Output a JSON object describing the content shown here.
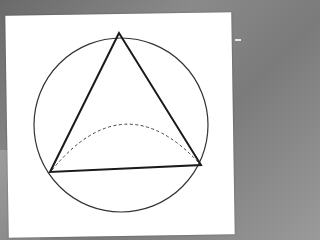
{
  "figure": {
    "type": "geometry-diagram",
    "colors": {
      "background": "#7b7b7b",
      "paper": "#ffffff",
      "stroke": "#1a1a1a",
      "circle_stroke": "#333333",
      "dashed_stroke": "#444444"
    },
    "circle": {
      "cx": 121,
      "cy": 125,
      "r": 87
    },
    "triangle": {
      "vertices": [
        {
          "name": "top",
          "x": 119,
          "y": 33
        },
        {
          "name": "bottom-left",
          "x": 50,
          "y": 172
        },
        {
          "name": "bottom-right",
          "x": 201,
          "y": 165
        }
      ]
    },
    "dashed_arc": {
      "start": {
        "x": 52,
        "y": 170
      },
      "control": {
        "x": 124,
        "y": 82
      },
      "end": {
        "x": 199,
        "y": 163
      }
    }
  }
}
